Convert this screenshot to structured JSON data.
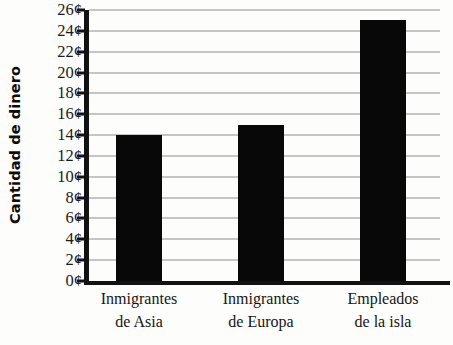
{
  "chart_data": {
    "type": "bar",
    "title": "",
    "subtitle": "",
    "xlabel": "",
    "ylabel": "Cantidad de dinero",
    "categories": [
      "Inmigrantes de Asia",
      "Inmigrantes de Europa",
      "Empleados de la isla"
    ],
    "category_lines": [
      [
        "Inmigrantes",
        "de Asia"
      ],
      [
        "Inmigrantes",
        "de Europa"
      ],
      [
        "Empleados",
        "de la isla"
      ]
    ],
    "values": [
      14,
      15,
      25
    ],
    "value_labels": [
      "14¢",
      "15¢",
      "25¢"
    ],
    "unit": "¢",
    "ylim": [
      0,
      26
    ],
    "ytick_step": 2,
    "ytick_values": [
      0,
      2,
      4,
      6,
      8,
      10,
      12,
      14,
      16,
      18,
      20,
      22,
      24,
      26
    ],
    "ytick_labels": [
      "0¢",
      "2¢",
      "4¢",
      "6¢",
      "8¢",
      "10¢",
      "12¢",
      "14¢",
      "16¢",
      "18¢",
      "20¢",
      "22¢",
      "24¢",
      "26¢"
    ],
    "grid": true,
    "grid_axis": "y",
    "legend": false,
    "legend_position": "none",
    "bar_color": "#080808",
    "grid_color": "#8d8d8d",
    "axis_color": "#121212",
    "background_color": "#fdfdfc"
  }
}
